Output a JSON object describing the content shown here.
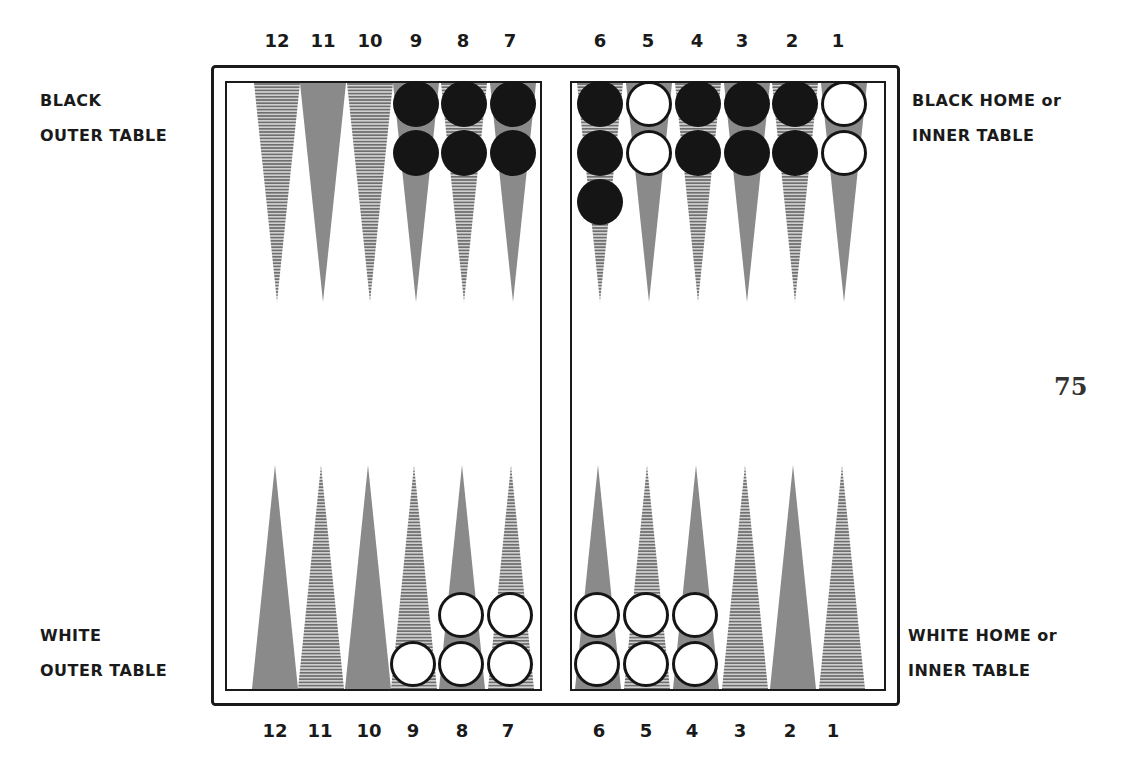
{
  "diagram": {
    "type": "backgammon-board-starting-position",
    "page_number": "75",
    "labels": {
      "black_outer": [
        "BLACK",
        "OUTER TABLE"
      ],
      "black_home": [
        "BLACK HOME or",
        "INNER TABLE"
      ],
      "white_outer": [
        "WHITE",
        "OUTER TABLE"
      ],
      "white_home": [
        "WHITE HOME or",
        "INNER TABLE"
      ]
    },
    "point_numbers_top": [
      "12",
      "11",
      "10",
      "9",
      "8",
      "7",
      "6",
      "5",
      "4",
      "3",
      "2",
      "1"
    ],
    "point_numbers_bottom": [
      "12",
      "11",
      "10",
      "9",
      "8",
      "7",
      "6",
      "5",
      "4",
      "3",
      "2",
      "1"
    ],
    "colors": {
      "board_line": "#1a1a1a",
      "solid_point": "#8a8a8a",
      "hatched_point": "#9a9a9a",
      "black_checker": "#151515",
      "white_checker": "#ffffff"
    },
    "top_points": [
      {
        "n": "12",
        "style": "hatched",
        "checkers": []
      },
      {
        "n": "11",
        "style": "solid",
        "checkers": []
      },
      {
        "n": "10",
        "style": "hatched",
        "checkers": []
      },
      {
        "n": "9",
        "style": "solid",
        "checkers": [
          "black",
          "black"
        ]
      },
      {
        "n": "8",
        "style": "hatched",
        "checkers": [
          "black",
          "black"
        ]
      },
      {
        "n": "7",
        "style": "solid",
        "checkers": [
          "black",
          "black"
        ]
      },
      {
        "n": "6",
        "style": "hatched",
        "checkers": [
          "black",
          "black",
          "black"
        ]
      },
      {
        "n": "5",
        "style": "solid",
        "checkers": [
          "white",
          "white"
        ]
      },
      {
        "n": "4",
        "style": "hatched",
        "checkers": [
          "black",
          "black"
        ]
      },
      {
        "n": "3",
        "style": "solid",
        "checkers": [
          "black",
          "black"
        ]
      },
      {
        "n": "2",
        "style": "hatched",
        "checkers": [
          "black",
          "black"
        ]
      },
      {
        "n": "1",
        "style": "solid",
        "checkers": [
          "white",
          "white"
        ]
      }
    ],
    "bottom_points": [
      {
        "n": "12",
        "style": "solid",
        "checkers": []
      },
      {
        "n": "11",
        "style": "hatched",
        "checkers": []
      },
      {
        "n": "10",
        "style": "solid",
        "checkers": []
      },
      {
        "n": "9",
        "style": "hatched",
        "checkers": [
          "white"
        ]
      },
      {
        "n": "8",
        "style": "solid",
        "checkers": [
          "white",
          "white"
        ]
      },
      {
        "n": "7",
        "style": "hatched",
        "checkers": [
          "white",
          "white"
        ]
      },
      {
        "n": "6",
        "style": "solid",
        "checkers": [
          "white",
          "white"
        ]
      },
      {
        "n": "5",
        "style": "hatched",
        "checkers": [
          "white",
          "white"
        ]
      },
      {
        "n": "4",
        "style": "solid",
        "checkers": [
          "white",
          "white"
        ]
      },
      {
        "n": "3",
        "style": "hatched",
        "checkers": []
      },
      {
        "n": "2",
        "style": "solid",
        "checkers": []
      },
      {
        "n": "1",
        "style": "hatched",
        "checkers": []
      }
    ]
  }
}
